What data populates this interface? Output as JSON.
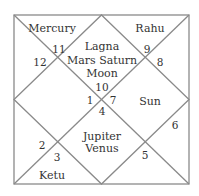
{
  "chart": {
    "style": "North Indian diamond birth chart",
    "line_color": "#8a8a8a",
    "text_color": "#333333",
    "houses": [
      {
        "house": 1,
        "sign_number": "10",
        "planets": [
          "Lagna",
          "Mars Saturn",
          "Moon"
        ]
      },
      {
        "house": 2,
        "sign_number": "11",
        "planets": [
          "Mercury"
        ]
      },
      {
        "house": 3,
        "sign_number": "12",
        "planets": []
      },
      {
        "house": 4,
        "sign_number": "1",
        "planets": []
      },
      {
        "house": 5,
        "sign_number": "2",
        "planets": []
      },
      {
        "house": 6,
        "sign_number": "3",
        "planets": [
          "Ketu"
        ]
      },
      {
        "house": 7,
        "sign_number": "4",
        "planets": [
          "Jupiter",
          "Venus"
        ]
      },
      {
        "house": 8,
        "sign_number": "5",
        "planets": []
      },
      {
        "house": 9,
        "sign_number": "6",
        "planets": []
      },
      {
        "house": 10,
        "sign_number": "7",
        "planets": [
          "Sun"
        ]
      },
      {
        "house": 11,
        "sign_number": "8",
        "planets": []
      },
      {
        "house": 12,
        "sign_number": "9",
        "planets": [
          "Rahu"
        ]
      }
    ]
  },
  "labels": {
    "mercury": "Mercury",
    "rahu": "Rahu",
    "lagna": "Lagna",
    "mars_saturn": "Mars Saturn",
    "moon": "Moon",
    "sun": "Sun",
    "jupiter": "Jupiter",
    "venus": "Venus",
    "ketu": "Ketu"
  },
  "numbers": {
    "n1": "1",
    "n2": "2",
    "n3": "3",
    "n4": "4",
    "n5": "5",
    "n6": "6",
    "n7": "7",
    "n8": "8",
    "n9": "9",
    "n10": "10",
    "n11": "11",
    "n12": "12"
  }
}
